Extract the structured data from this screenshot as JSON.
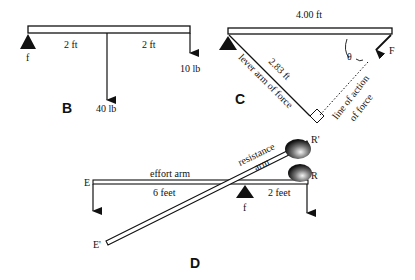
{
  "panels": {
    "B": {
      "label": "B",
      "fulcrum": "f",
      "dist_left": "2 ft",
      "dist_right": "2 ft",
      "load_middle": "40 lb",
      "load_end": "10 lb"
    },
    "C": {
      "label": "C",
      "beam_length": "4.00 ft",
      "lever_length": "2.83 ft",
      "lever_label": "lever arm of force",
      "line_action_1": "line of action",
      "line_action_2": "of force",
      "angle": "θ",
      "force": "F"
    },
    "D": {
      "label": "D",
      "effort": "E",
      "effort_prime": "E'",
      "effort_arm": "effort arm",
      "effort_dist": "6 feet",
      "resistance_arm_1": "resistance",
      "resistance_arm_2": "arm",
      "resistance_dist": "2 feet",
      "fulcrum": "f",
      "resistance": "R",
      "resistance_prime": "R'"
    }
  },
  "colors": {
    "ink": "#111111",
    "beam_fill": "#ffffff"
  }
}
